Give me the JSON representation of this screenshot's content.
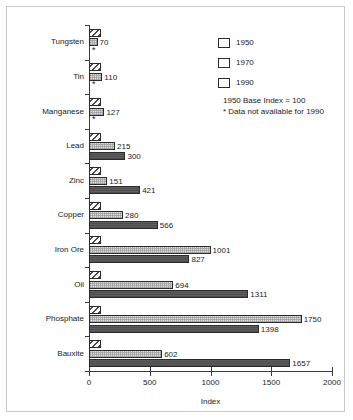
{
  "chart_data": {
    "type": "bar",
    "orientation": "horizontal",
    "title": "",
    "xlabel": "Index",
    "ylabel": "",
    "xlim": [
      0,
      2000
    ],
    "xticks": [
      0,
      500,
      1000,
      1500,
      2000
    ],
    "xticklabels": [
      "0",
      "500",
      "1000",
      "1500",
      "2000"
    ],
    "grid": false,
    "legend_position": "upper right",
    "categories": [
      "Tungsten",
      "Tin",
      "Manganese",
      "Lead",
      "Zinc",
      "Copper",
      "Iron Ore",
      "Oil",
      "Phosphate",
      "Bauxite"
    ],
    "series": [
      {
        "name": "1950",
        "fill": "diagonal-hatch",
        "color": "#ffffff",
        "values": [
          100,
          100,
          100,
          100,
          100,
          100,
          100,
          100,
          100,
          100
        ],
        "labels": [
          "",
          "",
          "",
          "",
          "",
          "",
          "",
          "",
          "",
          ""
        ]
      },
      {
        "name": "1970",
        "fill": "light-stipple",
        "color": "#dddddd",
        "values": [
          70,
          110,
          127,
          215,
          151,
          280,
          1001,
          694,
          1750,
          602
        ],
        "labels": [
          "70",
          "110",
          "127",
          "215",
          "151",
          "280",
          "1001",
          "694",
          "1750",
          "602"
        ]
      },
      {
        "name": "1990",
        "fill": "solid-dark",
        "color": "#5e5e5e",
        "values": [
          null,
          null,
          null,
          300,
          421,
          566,
          827,
          1311,
          1398,
          1657
        ],
        "labels": [
          "",
          "",
          "",
          "300",
          "421",
          "566",
          "827",
          "1311",
          "1398",
          "1657"
        ],
        "missing_marker": "*",
        "missing_categories": [
          "Tungsten",
          "Tin",
          "Manganese"
        ]
      }
    ],
    "annotations": [
      "1950 Base Index = 100",
      "* Data not available for 1990"
    ]
  },
  "legend": {
    "items": [
      {
        "label": "1950",
        "swatch": "diagonal-hatch-swatch"
      },
      {
        "label": "1970",
        "swatch": "light-stipple-swatch"
      },
      {
        "label": "1990",
        "swatch": "solid-dark-swatch"
      }
    ],
    "notes": "1950 Base Index = 100\n* Data not available for 1990"
  },
  "axis": {
    "x_title": "Index",
    "x_tick_labels": [
      "0",
      "500",
      "1000",
      "1500",
      "2000"
    ]
  }
}
